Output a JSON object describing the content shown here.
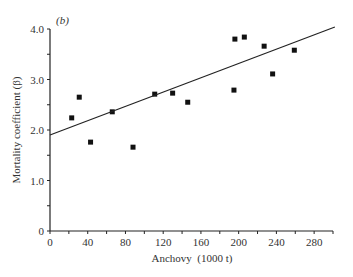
{
  "panel_label": "(b)",
  "chart_data": {
    "type": "scatter",
    "title": "",
    "panel": "(b)",
    "xlabel": "Anchovy  (1000 t)",
    "ylabel": "Mortality coefficient (β)",
    "xlim": [
      0,
      300
    ],
    "ylim": [
      0,
      4.0
    ],
    "x_ticks": [
      0,
      40,
      80,
      120,
      160,
      200,
      240,
      280
    ],
    "x_tick_labels": [
      "0",
      "40",
      "80",
      "120",
      "160",
      "200",
      "240",
      "280"
    ],
    "x_minor_step": 20,
    "y_ticks": [
      0,
      1.0,
      2.0,
      3.0,
      4.0
    ],
    "y_tick_labels": [
      "0",
      "1.0",
      "2.0",
      "3.0",
      "4.0"
    ],
    "y_minor_step": 0.5,
    "grid": false,
    "legend": null,
    "series": [
      {
        "name": "observations",
        "marker": "square",
        "points": [
          {
            "x": 23,
            "y": 2.24
          },
          {
            "x": 31,
            "y": 2.65
          },
          {
            "x": 43,
            "y": 1.76
          },
          {
            "x": 66,
            "y": 2.36
          },
          {
            "x": 88,
            "y": 1.66
          },
          {
            "x": 111,
            "y": 2.71
          },
          {
            "x": 130,
            "y": 2.73
          },
          {
            "x": 146,
            "y": 2.55
          },
          {
            "x": 195,
            "y": 2.79
          },
          {
            "x": 196,
            "y": 3.8
          },
          {
            "x": 206,
            "y": 3.84
          },
          {
            "x": 227,
            "y": 3.66
          },
          {
            "x": 236,
            "y": 3.11
          },
          {
            "x": 259,
            "y": 3.58
          }
        ]
      },
      {
        "name": "regression line",
        "type": "line",
        "points": [
          {
            "x": 0,
            "y": 1.9
          },
          {
            "x": 302,
            "y": 4.04
          }
        ]
      }
    ]
  }
}
